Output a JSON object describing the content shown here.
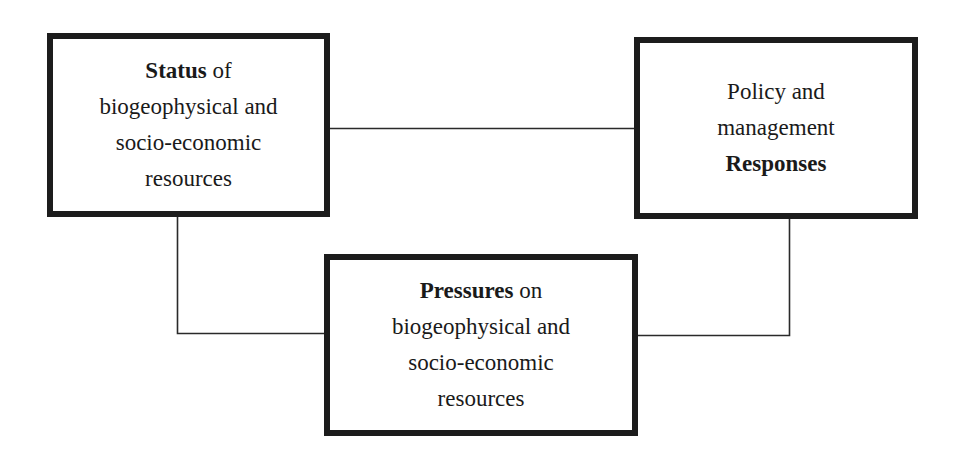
{
  "diagram": {
    "type": "conceptual-framework",
    "nodes": {
      "status": {
        "line1_bold": "Status",
        "line1_rest": " of",
        "line2": "biogeophysical and",
        "line3": "socio-economic",
        "line4": "resources"
      },
      "responses": {
        "line1": "Policy and",
        "line2": "management",
        "line3_bold": "Responses"
      },
      "pressures": {
        "line1_bold": "Pressures",
        "line1_rest": " on",
        "line2": "biogeophysical and",
        "line3": "socio-economic",
        "line4": "resources"
      }
    },
    "edges": [
      {
        "from": "status",
        "to": "responses"
      },
      {
        "from": "status",
        "to": "pressures"
      },
      {
        "from": "responses",
        "to": "pressures"
      }
    ],
    "colors": {
      "border": "#1c1c1c",
      "line": "#2a2a2a",
      "text": "#1a1a1a",
      "background": "#ffffff"
    }
  }
}
